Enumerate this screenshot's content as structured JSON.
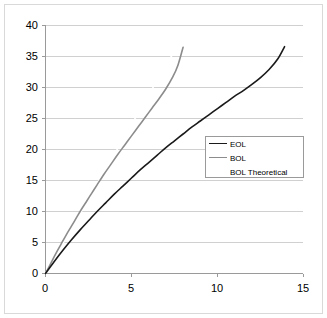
{
  "chart_data": {
    "type": "line",
    "title": "",
    "subtitle": "",
    "xlabel": "",
    "ylabel": "",
    "xlim": [
      0,
      15
    ],
    "ylim": [
      0,
      40
    ],
    "xticks": [
      "0",
      "5",
      "10",
      "15"
    ],
    "yticks": [
      "0",
      "5",
      "10",
      "15",
      "20",
      "25",
      "30",
      "35",
      "40"
    ],
    "grid": "horizontal",
    "legend_position": "center-right",
    "series": [
      {
        "name": "EOL",
        "color": "#1a1a1a",
        "x": [
          0,
          0.5,
          1,
          1.5,
          2,
          2.5,
          3,
          3.5,
          4,
          4.5,
          5,
          5.5,
          6,
          6.5,
          7,
          7.5,
          8,
          8.5,
          9,
          9.5,
          10,
          10.5,
          11,
          11.5,
          12,
          12.5,
          13,
          13.5,
          13.9
        ],
        "values": [
          0,
          1.9,
          3.7,
          5.4,
          7.0,
          8.5,
          10.0,
          11.4,
          12.8,
          14.1,
          15.4,
          16.7,
          17.9,
          19.1,
          20.3,
          21.4,
          22.5,
          23.6,
          24.6,
          25.6,
          26.6,
          27.6,
          28.6,
          29.5,
          30.5,
          31.6,
          32.9,
          34.6,
          36.6
        ]
      },
      {
        "name": "BOL",
        "color": "#8c8c8c",
        "x": [
          0,
          0.3,
          0.6,
          0.9,
          1.2,
          1.5,
          1.8,
          2.1,
          2.4,
          2.7,
          3,
          3.4,
          3.8,
          4.2,
          4.6,
          5,
          5.4,
          5.8,
          6.2,
          6.6,
          7,
          7.4,
          7.7,
          8
        ],
        "values": [
          0,
          1.6,
          3.2,
          4.7,
          6.2,
          7.6,
          9.0,
          10.4,
          11.7,
          13.0,
          14.3,
          16.0,
          17.6,
          19.2,
          20.7,
          22.2,
          23.7,
          25.2,
          26.7,
          28.2,
          29.8,
          31.7,
          33.6,
          36.5
        ]
      },
      {
        "name": "BOL Theoretical",
        "color": "#ffffff",
        "x": [
          0,
          1,
          2,
          3,
          4,
          5,
          6,
          7,
          8
        ],
        "values": [
          0,
          4.8,
          9.6,
          14.4,
          19.2,
          24.0,
          28.8,
          33.6,
          38.0
        ]
      }
    ]
  },
  "legend": {
    "entries": [
      {
        "label": "EOL"
      },
      {
        "label": "BOL"
      },
      {
        "label": "BOL Theoretical"
      }
    ]
  },
  "axes": {
    "y_labels": [
      "40",
      "35",
      "30",
      "25",
      "20",
      "15",
      "10",
      "5",
      "0"
    ],
    "x_labels": [
      "0",
      "5",
      "10",
      "15"
    ]
  }
}
